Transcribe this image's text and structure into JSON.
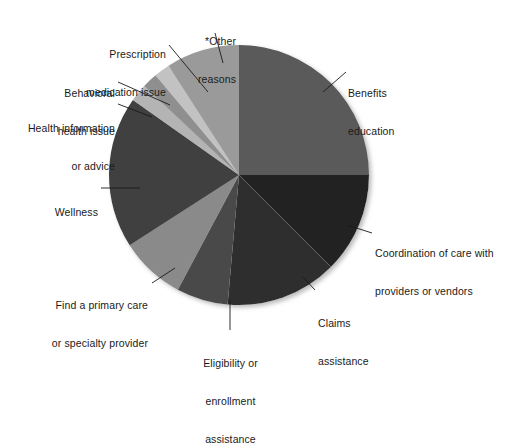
{
  "chart_data": {
    "type": "pie",
    "title": "",
    "subtitle": "",
    "xlabel": "",
    "ylabel": "",
    "legend_position": "none",
    "grid": false,
    "labels_placement": "callout-leader-lines",
    "start_angle_deg": 0,
    "direction": "clockwise",
    "categories": [
      "Benefits education",
      "Coordination of care with providers or vendors",
      "Claims assistance",
      "Eligibility or enrollment assistance",
      "Find a primary care or specialty provider",
      "Wellness",
      "Health information or advice",
      "Behavioral health issue",
      "Prescription medication issue",
      "*Other reasons"
    ],
    "values": [
      25.0,
      12.5,
      13.9,
      6.4,
      8.1,
      18.9,
      2.2,
      1.9,
      2.0,
      9.1
    ],
    "colors": [
      "#5a5a5a",
      "#232323",
      "#2e2e2e",
      "#4a4a4a",
      "#8a8a8a",
      "#3f3f3f",
      "#b4b4b4",
      "#8f8f8f",
      "#c2c2c2",
      "#9a9a9a"
    ],
    "annotations": [
      "*Other reasons"
    ]
  },
  "labels": {
    "benefits_education": [
      "Benefits",
      "education"
    ],
    "coordination_of_care": [
      "Coordination of care with",
      "providers or vendors"
    ],
    "claims_assistance": [
      "Claims",
      "assistance"
    ],
    "eligibility_enrollment": [
      "Eligibility or",
      "enrollment",
      "assistance"
    ],
    "find_provider": [
      "Find a primary care",
      "or specialty provider"
    ],
    "wellness": [
      "Wellness"
    ],
    "health_information": [
      "Health information",
      "or advice"
    ],
    "behavioral_health": [
      "Behavioral",
      "health issue"
    ],
    "prescription_medication": [
      "Prescription",
      "medication issue"
    ],
    "other_reasons": [
      "*Other reasons"
    ],
    "other_reasons_l1": "*Other",
    "other_reasons_l2": "reasons"
  },
  "text": {
    "benefits_education_l1": "Benefits",
    "benefits_education_l2": "education",
    "coordination_l1": "Coordination of care with",
    "coordination_l2": "providers or vendors",
    "claims_l1": "Claims",
    "claims_l2": "assistance",
    "eligibility_l1": "Eligibility or",
    "eligibility_l2": "enrollment",
    "eligibility_l3": "assistance",
    "find_provider_l1": "Find a primary care",
    "find_provider_l2": "or specialty provider",
    "wellness_l1": "Wellness",
    "health_info_l1": "Health information",
    "health_info_l2": "or advice",
    "behavioral_l1": "Behavioral",
    "behavioral_l2": "health issue",
    "prescription_l1": "Prescription",
    "prescription_l2": "medication issue",
    "other_l1": "*Other",
    "other_l2": "reasons"
  },
  "geometry": {
    "center_x": 239,
    "center_y": 175,
    "radius": 130
  },
  "colors": {
    "background": "#ffffff",
    "text": "#1a1a1a",
    "leader_line": "#1a1a1a"
  }
}
